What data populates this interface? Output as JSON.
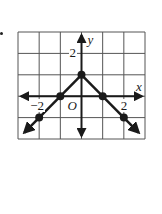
{
  "chart_data": {
    "type": "line",
    "title": "",
    "xlabel": "x",
    "ylabel": "y",
    "origin_label": "O",
    "xlim": [
      -3,
      3
    ],
    "ylim": [
      -2,
      3
    ],
    "grid": true,
    "tick_labels": {
      "x": [
        {
          "value": -2,
          "label": "−2"
        },
        {
          "value": 2,
          "label": "2"
        }
      ],
      "y": [
        {
          "value": 2,
          "label": "2"
        }
      ]
    },
    "series": [
      {
        "name": "y = -|x| + 1",
        "points": [
          [
            -2,
            -1
          ],
          [
            -1,
            0
          ],
          [
            0,
            1
          ],
          [
            1,
            0
          ],
          [
            2,
            -1
          ]
        ],
        "extends_with_arrows": true,
        "color": "#1a1a1a"
      }
    ]
  },
  "labels": {
    "x_axis": "x",
    "y_axis": "y",
    "origin": "O",
    "x_tick_neg2": "−2",
    "x_tick_2": "2",
    "y_tick_2": "2"
  }
}
